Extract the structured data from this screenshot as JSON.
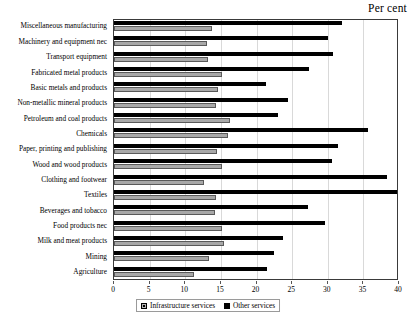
{
  "chart_data": {
    "type": "bar",
    "orientation": "horizontal",
    "title": "",
    "unit_label": "Per cent",
    "xlabel": "",
    "ylabel": "",
    "xlim": [
      0,
      40
    ],
    "xticks": [
      0,
      5,
      10,
      15,
      20,
      25,
      30,
      35,
      40
    ],
    "grid": true,
    "legend_position": "bottom-center",
    "categories": [
      "Miscellaneous manufacturing",
      "Machinery and equipment nec",
      "Transport equipment",
      "Fabricated metal products",
      "Basic metals and products",
      "Non-metallic mineral products",
      "Petroleum and coal products",
      "Chemicals",
      "Paper, printing and publishing",
      "Wood and wood products",
      "Clothing and footwear",
      "Textiles",
      "Beverages and tobacco",
      "Food products nec",
      "Milk and meat products",
      "Mining",
      "Agriculture"
    ],
    "series": [
      {
        "name": "Infrastructure services",
        "color": "#a8a8a8",
        "values": [
          13.8,
          13.0,
          13.2,
          15.1,
          14.6,
          14.3,
          16.3,
          16.0,
          14.4,
          15.2,
          12.6,
          14.3,
          14.2,
          15.1,
          15.4,
          13.3,
          11.2
        ]
      },
      {
        "name": "Other services",
        "color": "#000000",
        "values": [
          32.0,
          30.0,
          30.8,
          27.4,
          21.3,
          24.4,
          23.0,
          35.6,
          31.5,
          30.6,
          38.3,
          39.8,
          27.2,
          29.6,
          23.7,
          22.4,
          21.5
        ]
      }
    ]
  },
  "legend": {
    "items": [
      {
        "label": "Infrastructure services",
        "swatch": "hatched-gray-square"
      },
      {
        "label": "Other services",
        "swatch": "solid-black-square"
      }
    ]
  }
}
